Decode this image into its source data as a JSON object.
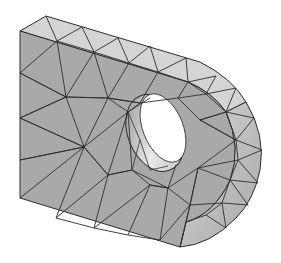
{
  "figure": {
    "caption": "",
    "colors": {
      "background": "#ffffff",
      "front_face": "#a9a9a9",
      "top_face": "#d4d4d4",
      "rim_face": "#c6c6c6",
      "hole_inner_light": "#e6e6e6",
      "hole_inner_dark": "#8c8c8c",
      "edge": "#2e2e2e",
      "hole_opening": "#ffffff"
    },
    "parts": [
      "top-face",
      "front-face",
      "curved-rim",
      "through-hole"
    ]
  }
}
